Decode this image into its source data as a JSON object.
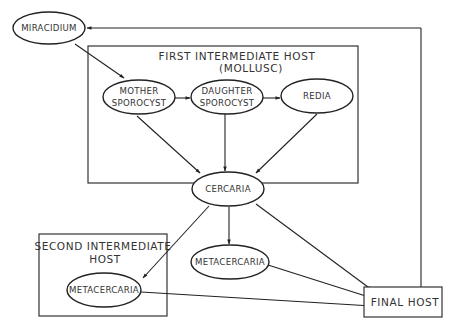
{
  "diagram": {
    "type": "life-cycle flow diagram",
    "containers": {
      "first_host": {
        "title_line1": "FIRST INTERMEDIATE HOST",
        "title_line2": "(MOLLUSC)"
      },
      "second_host": {
        "title_line1": "SECOND INTERMEDIATE",
        "title_line2": "HOST"
      },
      "final_host": {
        "label": "FINAL HOST"
      }
    },
    "nodes": {
      "miracidium": "MIRACIDIUM",
      "mother_sporocyst": {
        "line1": "MOTHER",
        "line2": "SPOROCYST"
      },
      "daughter_sporocyst": {
        "line1": "DAUGHTER",
        "line2": "SPOROCYST"
      },
      "redia": "REDIA",
      "cercaria": "CERCARIA",
      "metacercaria_free": "METACERCARIA",
      "metacercaria_second_host": "METACERCARIA"
    },
    "edges": [
      {
        "from": "MIRACIDIUM",
        "to": "MOTHER SPOROCYST"
      },
      {
        "from": "MOTHER SPOROCYST",
        "to": "DAUGHTER SPOROCYST"
      },
      {
        "from": "DAUGHTER SPOROCYST",
        "to": "REDIA"
      },
      {
        "from": "MOTHER SPOROCYST",
        "to": "CERCARIA"
      },
      {
        "from": "DAUGHTER SPOROCYST",
        "to": "CERCARIA"
      },
      {
        "from": "REDIA",
        "to": "CERCARIA"
      },
      {
        "from": "CERCARIA",
        "to": "METACERCARIA (second intermediate host)"
      },
      {
        "from": "CERCARIA",
        "to": "METACERCARIA"
      },
      {
        "from": "CERCARIA",
        "to": "FINAL HOST"
      },
      {
        "from": "METACERCARIA",
        "to": "FINAL HOST"
      },
      {
        "from": "METACERCARIA (second intermediate host)",
        "to": "FINAL HOST"
      },
      {
        "from": "FINAL HOST",
        "to": "MIRACIDIUM"
      }
    ]
  }
}
